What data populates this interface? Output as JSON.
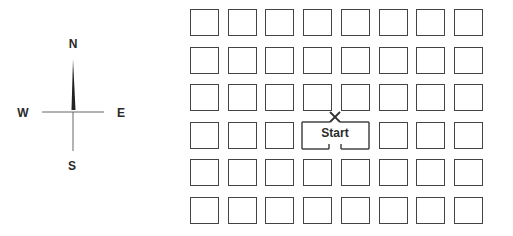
{
  "compass": {
    "north": "N",
    "south": "S",
    "east": "E",
    "west": "W",
    "needle_direction": "north"
  },
  "grid": {
    "columns": 8,
    "rows": 6,
    "origin_x": 190,
    "origin_y": 9,
    "pitch_x": 37.7,
    "pitch_y": 37.6,
    "cell_w": 28,
    "cell_h": 26,
    "merged_cells": [
      {
        "row": 3,
        "col": 3
      },
      {
        "row": 3,
        "col": 4
      }
    ]
  },
  "start": {
    "label": "Start",
    "marker": "X"
  },
  "colors": {
    "line": "#444444",
    "text": "#2a2a2a",
    "background": "#ffffff"
  }
}
